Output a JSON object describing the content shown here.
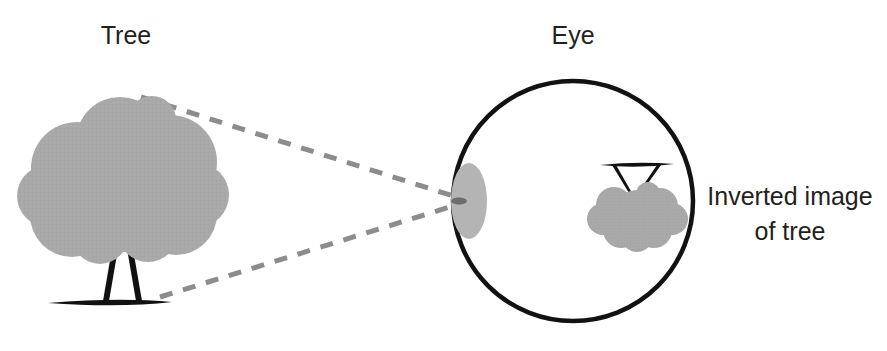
{
  "figure": {
    "background_color": "#ffffff"
  },
  "labels": {
    "tree": "Tree",
    "eye": "Eye",
    "inverted_image_line1": "Inverted image",
    "inverted_image_line2": "of tree"
  },
  "colors": {
    "foliage_gray": "#a9a9a9",
    "lens_gray": "#b4b4b4",
    "ray_gray": "#8c8c8c",
    "outline_black": "#121212",
    "text_black": "#231f20"
  },
  "elements": {
    "tree_label_name": "Tree",
    "eye_label_name": "Eye",
    "object_tree_name": "tree-object",
    "eye_ball_name": "eyeball-outline",
    "lens_name": "eye-lens",
    "image_tree_name": "inverted-tree-image",
    "ray_upper_name": "light-ray-upper",
    "ray_lower_name": "light-ray-lower"
  },
  "geometry": {
    "canvas_width": 887,
    "canvas_height": 351,
    "eye_center_x": 573,
    "eye_center_y": 201,
    "eye_radius": 120,
    "lens_center_x": 469,
    "lens_center_y": 201,
    "lens_rx": 17,
    "lens_ry": 37,
    "ray_dash": "13 11",
    "ray_width": 5
  }
}
